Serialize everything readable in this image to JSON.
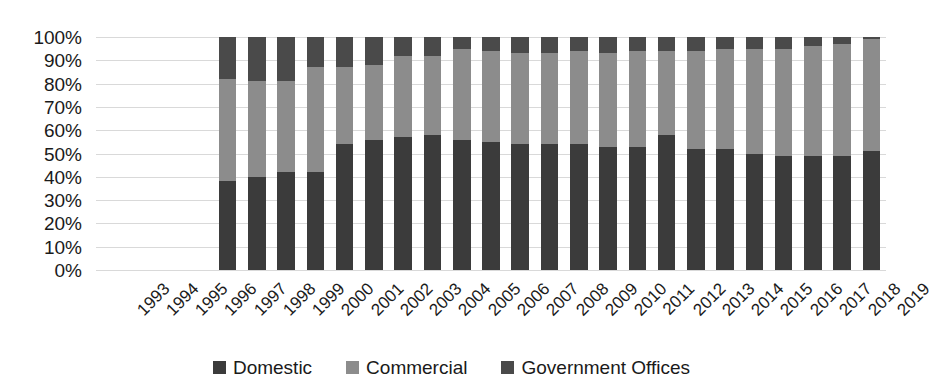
{
  "chart_data": {
    "type": "bar",
    "subtype": "stacked-100-percent",
    "title": "",
    "xlabel": "",
    "ylabel": "",
    "ylim": [
      0,
      100
    ],
    "ytick_labels": [
      "100%",
      "90%",
      "80%",
      "70%",
      "60%",
      "50%",
      "40%",
      "30%",
      "20%",
      "10%",
      "0%"
    ],
    "ytick_values": [
      100,
      90,
      80,
      70,
      60,
      50,
      40,
      30,
      20,
      10,
      0
    ],
    "grid": true,
    "legend_position": "bottom",
    "categories": [
      "1993",
      "1994",
      "1995",
      "1996",
      "1997",
      "1998",
      "1999",
      "2000",
      "2001",
      "2002",
      "2003",
      "2004",
      "2005",
      "2006",
      "2007",
      "2008",
      "2009",
      "2010",
      "2011",
      "2012",
      "2013",
      "2014",
      "2015",
      "2016",
      "2017",
      "2018",
      "2019"
    ],
    "series": [
      {
        "name": "Domestic",
        "color": "#3b3b3b",
        "values": [
          null,
          null,
          null,
          null,
          38,
          40,
          42,
          42,
          54,
          56,
          57,
          58,
          56,
          55,
          54,
          54,
          54,
          53,
          53,
          58,
          52,
          52,
          50,
          49,
          49,
          49,
          51
        ]
      },
      {
        "name": "Commercial",
        "color": "#8c8c8c",
        "values": [
          null,
          null,
          null,
          null,
          44,
          41,
          39,
          45,
          33,
          32,
          35,
          34,
          39,
          39,
          39,
          39,
          40,
          40,
          41,
          36,
          42,
          43,
          45,
          46,
          47,
          48,
          48
        ]
      },
      {
        "name": "Government Offices",
        "color": "#4a4a4a",
        "values": [
          null,
          null,
          null,
          null,
          18,
          19,
          19,
          13,
          13,
          12,
          8,
          8,
          5,
          6,
          7,
          7,
          6,
          7,
          6,
          6,
          6,
          5,
          5,
          5,
          4,
          3,
          1
        ]
      }
    ]
  },
  "legend": {
    "items": [
      {
        "label": "Domestic",
        "color": "#3b3b3b"
      },
      {
        "label": "Commercial",
        "color": "#8c8c8c"
      },
      {
        "label": "Government Offices",
        "color": "#4a4a4a"
      }
    ]
  },
  "colors": {
    "gridline": "#d9d9d9",
    "text": "#1a1a1a",
    "background": "#ffffff"
  }
}
